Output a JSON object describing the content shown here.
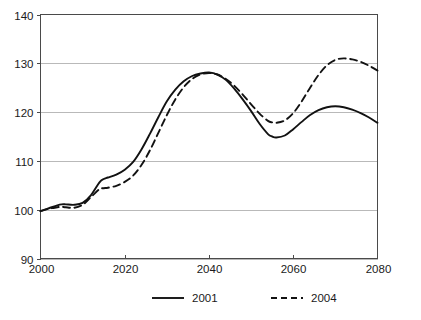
{
  "chart_data": {
    "type": "line",
    "title": "",
    "subtitle": "",
    "xlabel": "",
    "ylabel": "",
    "xlim": [
      2000,
      2080
    ],
    "ylim": [
      90,
      140
    ],
    "xticks": [
      "2000",
      "2020",
      "2040",
      "2060",
      "2080"
    ],
    "yticks": [
      "90",
      "100",
      "110",
      "120",
      "130",
      "140"
    ],
    "grid": "horizontal",
    "legend_position": "bottom-center",
    "colors": {
      "series_line": "#121212",
      "gridline": "#b9b9b9",
      "axis": "#4a4a4a",
      "background": "#ffffff"
    },
    "x": [
      2000,
      2002,
      2004,
      2005,
      2006,
      2008,
      2010,
      2012,
      2014,
      2015,
      2016,
      2018,
      2020,
      2022,
      2024,
      2026,
      2028,
      2030,
      2032,
      2034,
      2036,
      2038,
      2040,
      2042,
      2044,
      2046,
      2048,
      2050,
      2052,
      2054,
      2055,
      2056,
      2058,
      2060,
      2062,
      2064,
      2066,
      2068,
      2070,
      2072,
      2074,
      2076,
      2078,
      2080
    ],
    "series": [
      {
        "name": "2001",
        "style": "solid",
        "values": [
          99.7,
          100.3,
          100.9,
          101.1,
          101.1,
          101.0,
          101.4,
          103.0,
          105.6,
          106.3,
          106.6,
          107.2,
          108.2,
          109.8,
          112.4,
          115.6,
          119.0,
          122.2,
          124.6,
          126.3,
          127.4,
          127.9,
          128.1,
          127.7,
          126.6,
          124.8,
          122.6,
          120.2,
          117.6,
          115.5,
          115.0,
          114.8,
          115.2,
          116.5,
          118.0,
          119.4,
          120.4,
          121.0,
          121.2,
          121.0,
          120.5,
          119.8,
          118.9,
          117.8
        ]
      },
      {
        "name": "2004",
        "style": "dashed",
        "values": [
          99.7,
          100.2,
          100.5,
          100.6,
          100.5,
          100.4,
          101.0,
          102.6,
          104.2,
          104.4,
          104.5,
          104.9,
          105.7,
          107.0,
          109.2,
          112.2,
          115.8,
          119.4,
          122.6,
          125.1,
          126.8,
          127.7,
          128.0,
          127.7,
          126.8,
          125.4,
          123.6,
          121.6,
          119.7,
          118.2,
          117.9,
          117.8,
          118.3,
          119.8,
          122.2,
          125.0,
          127.6,
          129.6,
          130.7,
          131.0,
          130.8,
          130.3,
          129.5,
          128.5
        ]
      }
    ],
    "legend": [
      {
        "label": "2001",
        "style": "solid"
      },
      {
        "label": "2004",
        "style": "dashed"
      }
    ]
  },
  "figure": {
    "caption_stub": ""
  }
}
